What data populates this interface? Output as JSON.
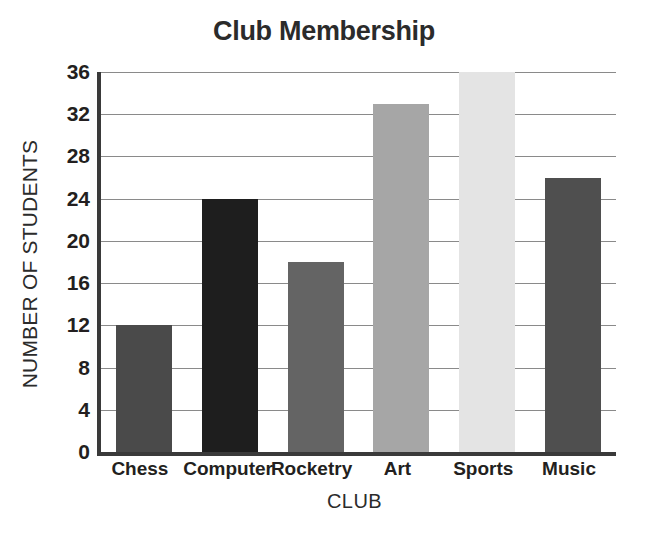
{
  "chart_data": {
    "type": "bar",
    "title": "Club Membership",
    "xlabel": "CLUB",
    "ylabel": "NUMBER OF STUDENTS",
    "categories": [
      "Chess",
      "Computer",
      "Rocketry",
      "Art",
      "Sports",
      "Music"
    ],
    "values": [
      12,
      24,
      18,
      33,
      36,
      26
    ],
    "bar_colors": [
      "#4a4a4a",
      "#1e1e1e",
      "#646464",
      "#a6a6a6",
      "#e4e4e4",
      "#4f4f4f"
    ],
    "ylim": [
      0,
      36
    ],
    "ytick_step": 4,
    "yticks": [
      0,
      4,
      8,
      12,
      16,
      20,
      24,
      28,
      32,
      36
    ],
    "ytick_labels": [
      "0",
      "4",
      "8",
      "12",
      "16",
      "20",
      "24",
      "28",
      "32",
      "36"
    ],
    "grid": true,
    "grid_color": "#8a8a8a",
    "axis_color": "#3a3a3a",
    "legend": null,
    "background": "#ffffff"
  }
}
